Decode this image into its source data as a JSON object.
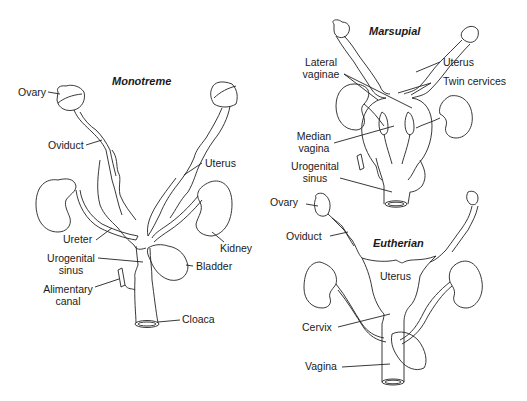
{
  "diagram": {
    "panels": [
      {
        "id": "monotreme",
        "title": "Monotreme",
        "labels": {
          "ovary": "Ovary",
          "oviduct": "Oviduct",
          "uterus": "Uterus",
          "ureter": "Ureter",
          "kidney": "Kidney",
          "urogenital_sinus_1": "Urogenital",
          "urogenital_sinus_2": "sinus",
          "bladder": "Bladder",
          "alimentary_canal_1": "Alimentary",
          "alimentary_canal_2": "canal",
          "cloaca": "Cloaca"
        }
      },
      {
        "id": "marsupial",
        "title": "Marsupial",
        "labels": {
          "lateral_vaginae_1": "Lateral",
          "lateral_vaginae_2": "vaginae",
          "uterus": "Uterus",
          "twin_cervices": "Twin cervices",
          "median_vagina_1": "Median",
          "median_vagina_2": "vagina",
          "urogenital_sinus_1": "Urogenital",
          "urogenital_sinus_2": "sinus"
        }
      },
      {
        "id": "eutherian",
        "title": "Eutherian",
        "labels": {
          "ovary": "Ovary",
          "oviduct": "Oviduct",
          "uterus": "Uterus",
          "cervix": "Cervix",
          "vagina": "Vagina"
        }
      }
    ]
  }
}
